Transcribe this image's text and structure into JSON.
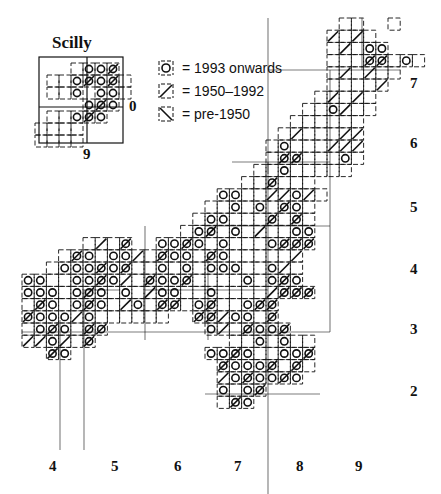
{
  "inset": {
    "title": "Scilly",
    "right_label": "0",
    "bottom_label": "9"
  },
  "legend": [
    {
      "symbol": "circle",
      "label": "= 1993 onwards"
    },
    {
      "symbol": "slash",
      "label": "= 1950–1992"
    },
    {
      "symbol": "backslash",
      "label": "= pre-1950"
    }
  ],
  "x_axis": {
    "labels": [
      "4",
      "5",
      "6",
      "7",
      "8",
      "9"
    ],
    "positions": [
      53,
      115,
      178,
      238,
      300,
      359
    ]
  },
  "y_axis": {
    "labels": [
      "7",
      "6",
      "5",
      "4",
      "3",
      "2"
    ],
    "positions": [
      84,
      144,
      208,
      270,
      330,
      392
    ]
  },
  "grid": {
    "cell": 12.2,
    "origin_x": 22,
    "origin_y": 18
  },
  "colors": {
    "ink": "#111111",
    "background": "#ffffff"
  },
  "main_cells": [
    [
      26,
      0,
      ""
    ],
    [
      27,
      0,
      ""
    ],
    [
      30,
      0,
      ""
    ],
    [
      25,
      1,
      "/"
    ],
    [
      26,
      1,
      ""
    ],
    [
      27,
      1,
      "/"
    ],
    [
      28,
      1,
      ""
    ],
    [
      25,
      2,
      ""
    ],
    [
      26,
      2,
      "/"
    ],
    [
      27,
      2,
      ""
    ],
    [
      28,
      2,
      "o"
    ],
    [
      29,
      2,
      "o"
    ],
    [
      25,
      3,
      ""
    ],
    [
      26,
      3,
      ""
    ],
    [
      27,
      3,
      ""
    ],
    [
      28,
      3,
      "x"
    ],
    [
      29,
      3,
      "x"
    ],
    [
      30,
      3,
      ""
    ],
    [
      31,
      3,
      "o"
    ],
    [
      32,
      3,
      ""
    ],
    [
      25,
      4,
      ""
    ],
    [
      26,
      4,
      "/"
    ],
    [
      27,
      4,
      ""
    ],
    [
      28,
      4,
      "/"
    ],
    [
      29,
      4,
      ""
    ],
    [
      30,
      4,
      ""
    ],
    [
      25,
      5,
      ""
    ],
    [
      26,
      5,
      ""
    ],
    [
      27,
      5,
      ""
    ],
    [
      28,
      5,
      ""
    ],
    [
      29,
      5,
      "/"
    ],
    [
      24,
      6,
      ""
    ],
    [
      25,
      6,
      "/"
    ],
    [
      26,
      6,
      ""
    ],
    [
      27,
      6,
      "/"
    ],
    [
      28,
      6,
      ""
    ],
    [
      23,
      7,
      ""
    ],
    [
      24,
      7,
      ""
    ],
    [
      25,
      7,
      "o"
    ],
    [
      26,
      7,
      "/"
    ],
    [
      27,
      7,
      ""
    ],
    [
      28,
      7,
      ""
    ],
    [
      22,
      8,
      ""
    ],
    [
      23,
      8,
      ""
    ],
    [
      24,
      8,
      ""
    ],
    [
      25,
      8,
      ""
    ],
    [
      26,
      8,
      ""
    ],
    [
      27,
      8,
      ""
    ],
    [
      21,
      9,
      ""
    ],
    [
      22,
      9,
      "/"
    ],
    [
      23,
      9,
      ""
    ],
    [
      24,
      9,
      ""
    ],
    [
      25,
      9,
      ""
    ],
    [
      26,
      9,
      "/"
    ],
    [
      27,
      9,
      "/"
    ],
    [
      20,
      10,
      ""
    ],
    [
      21,
      10,
      "o"
    ],
    [
      22,
      10,
      ""
    ],
    [
      23,
      10,
      ""
    ],
    [
      24,
      10,
      ""
    ],
    [
      25,
      10,
      "/"
    ],
    [
      26,
      10,
      "/"
    ],
    [
      27,
      10,
      "/"
    ],
    [
      20,
      11,
      ""
    ],
    [
      21,
      11,
      "x"
    ],
    [
      22,
      11,
      "x"
    ],
    [
      23,
      11,
      ""
    ],
    [
      24,
      11,
      ""
    ],
    [
      25,
      11,
      ""
    ],
    [
      26,
      11,
      "o"
    ],
    [
      27,
      11,
      ""
    ],
    [
      19,
      12,
      ""
    ],
    [
      20,
      12,
      ""
    ],
    [
      21,
      12,
      "o"
    ],
    [
      22,
      12,
      ""
    ],
    [
      23,
      12,
      ""
    ],
    [
      24,
      12,
      ""
    ],
    [
      25,
      12,
      ""
    ],
    [
      26,
      12,
      ""
    ],
    [
      18,
      13,
      ""
    ],
    [
      19,
      13,
      ""
    ],
    [
      20,
      13,
      "x"
    ],
    [
      21,
      13,
      ""
    ],
    [
      22,
      13,
      ""
    ],
    [
      23,
      13,
      ""
    ],
    [
      16,
      14,
      "o"
    ],
    [
      17,
      14,
      "o"
    ],
    [
      18,
      14,
      ""
    ],
    [
      19,
      14,
      ""
    ],
    [
      20,
      14,
      "/"
    ],
    [
      21,
      14,
      "/"
    ],
    [
      22,
      14,
      "o"
    ],
    [
      23,
      14,
      "/"
    ],
    [
      24,
      14,
      ""
    ],
    [
      15,
      15,
      ""
    ],
    [
      16,
      15,
      ""
    ],
    [
      17,
      15,
      "o"
    ],
    [
      18,
      15,
      ""
    ],
    [
      19,
      15,
      "o"
    ],
    [
      20,
      15,
      ""
    ],
    [
      21,
      15,
      "x"
    ],
    [
      22,
      15,
      "o"
    ],
    [
      23,
      15,
      ""
    ],
    [
      14,
      16,
      ""
    ],
    [
      15,
      16,
      "o"
    ],
    [
      16,
      16,
      "o"
    ],
    [
      17,
      16,
      ""
    ],
    [
      18,
      16,
      ""
    ],
    [
      19,
      16,
      ""
    ],
    [
      20,
      16,
      "x"
    ],
    [
      21,
      16,
      ""
    ],
    [
      22,
      16,
      "x"
    ],
    [
      23,
      16,
      ""
    ],
    [
      13,
      17,
      ""
    ],
    [
      14,
      17,
      "o"
    ],
    [
      15,
      17,
      "x"
    ],
    [
      16,
      17,
      ""
    ],
    [
      17,
      17,
      "o"
    ],
    [
      18,
      17,
      ""
    ],
    [
      19,
      17,
      "/"
    ],
    [
      20,
      17,
      ""
    ],
    [
      21,
      17,
      ""
    ],
    [
      22,
      17,
      "o"
    ],
    [
      23,
      17,
      "o"
    ],
    [
      5,
      18,
      ""
    ],
    [
      6,
      18,
      "/"
    ],
    [
      7,
      18,
      ""
    ],
    [
      8,
      18,
      "x"
    ],
    [
      11,
      18,
      "o"
    ],
    [
      12,
      18,
      "o"
    ],
    [
      13,
      18,
      "x"
    ],
    [
      14,
      18,
      "o"
    ],
    [
      15,
      18,
      ""
    ],
    [
      16,
      18,
      "o"
    ],
    [
      17,
      18,
      ""
    ],
    [
      18,
      18,
      ""
    ],
    [
      19,
      18,
      ""
    ],
    [
      20,
      18,
      "o"
    ],
    [
      21,
      18,
      "x"
    ],
    [
      22,
      18,
      "x"
    ],
    [
      23,
      18,
      "x"
    ],
    [
      3,
      19,
      ""
    ],
    [
      4,
      19,
      "x"
    ],
    [
      5,
      19,
      "o"
    ],
    [
      6,
      19,
      ""
    ],
    [
      7,
      19,
      "o"
    ],
    [
      8,
      19,
      "o"
    ],
    [
      9,
      19,
      "/"
    ],
    [
      10,
      19,
      ""
    ],
    [
      11,
      19,
      "x"
    ],
    [
      12,
      19,
      "o"
    ],
    [
      13,
      19,
      "o"
    ],
    [
      14,
      19,
      ""
    ],
    [
      15,
      19,
      "x"
    ],
    [
      16,
      19,
      "o"
    ],
    [
      17,
      19,
      ""
    ],
    [
      18,
      19,
      ""
    ],
    [
      19,
      19,
      ""
    ],
    [
      20,
      19,
      ""
    ],
    [
      21,
      19,
      ""
    ],
    [
      22,
      19,
      "/"
    ],
    [
      2,
      20,
      ""
    ],
    [
      3,
      20,
      "o"
    ],
    [
      4,
      20,
      "o"
    ],
    [
      5,
      20,
      "o"
    ],
    [
      6,
      20,
      "x"
    ],
    [
      7,
      20,
      "o"
    ],
    [
      8,
      20,
      "x"
    ],
    [
      9,
      20,
      ""
    ],
    [
      10,
      20,
      ""
    ],
    [
      11,
      20,
      "o"
    ],
    [
      12,
      20,
      ""
    ],
    [
      13,
      20,
      "o"
    ],
    [
      14,
      20,
      ""
    ],
    [
      15,
      20,
      "o"
    ],
    [
      16,
      20,
      "o"
    ],
    [
      17,
      20,
      "o"
    ],
    [
      18,
      20,
      ""
    ],
    [
      19,
      20,
      ""
    ],
    [
      20,
      20,
      "o"
    ],
    [
      21,
      20,
      "/"
    ],
    [
      22,
      20,
      ""
    ],
    [
      0,
      21,
      "o"
    ],
    [
      1,
      21,
      "o"
    ],
    [
      2,
      21,
      ""
    ],
    [
      3,
      21,
      ""
    ],
    [
      4,
      21,
      "o"
    ],
    [
      5,
      21,
      "o"
    ],
    [
      6,
      21,
      "x"
    ],
    [
      7,
      21,
      "o"
    ],
    [
      8,
      21,
      "/"
    ],
    [
      9,
      21,
      ""
    ],
    [
      10,
      21,
      "x"
    ],
    [
      11,
      21,
      "o"
    ],
    [
      12,
      21,
      "o"
    ],
    [
      13,
      21,
      "x"
    ],
    [
      14,
      21,
      ""
    ],
    [
      15,
      21,
      ""
    ],
    [
      16,
      21,
      ""
    ],
    [
      17,
      21,
      ""
    ],
    [
      18,
      21,
      "o"
    ],
    [
      19,
      21,
      ""
    ],
    [
      20,
      21,
      "o"
    ],
    [
      21,
      21,
      "x"
    ],
    [
      22,
      21,
      "o"
    ],
    [
      0,
      22,
      "o"
    ],
    [
      1,
      22,
      "o"
    ],
    [
      2,
      22,
      "o"
    ],
    [
      3,
      22,
      ""
    ],
    [
      4,
      22,
      "o"
    ],
    [
      5,
      22,
      "x"
    ],
    [
      6,
      22,
      "o"
    ],
    [
      7,
      22,
      ""
    ],
    [
      8,
      22,
      "o"
    ],
    [
      9,
      22,
      ""
    ],
    [
      10,
      22,
      "/"
    ],
    [
      11,
      22,
      "o"
    ],
    [
      12,
      22,
      "o"
    ],
    [
      13,
      22,
      ""
    ],
    [
      14,
      22,
      ""
    ],
    [
      15,
      22,
      "o"
    ],
    [
      16,
      22,
      ""
    ],
    [
      17,
      22,
      ""
    ],
    [
      18,
      22,
      ""
    ],
    [
      19,
      22,
      ""
    ],
    [
      20,
      22,
      "/"
    ],
    [
      21,
      22,
      "x"
    ],
    [
      22,
      22,
      "x"
    ],
    [
      23,
      22,
      "x"
    ],
    [
      0,
      23,
      ""
    ],
    [
      1,
      23,
      "x"
    ],
    [
      2,
      23,
      "o"
    ],
    [
      3,
      23,
      ""
    ],
    [
      4,
      23,
      "o"
    ],
    [
      5,
      23,
      "x"
    ],
    [
      6,
      23,
      "o"
    ],
    [
      7,
      23,
      ""
    ],
    [
      8,
      23,
      "/"
    ],
    [
      9,
      23,
      "o"
    ],
    [
      10,
      23,
      ""
    ],
    [
      11,
      23,
      "x"
    ],
    [
      12,
      23,
      "x"
    ],
    [
      13,
      23,
      ""
    ],
    [
      14,
      23,
      "o"
    ],
    [
      15,
      23,
      "x"
    ],
    [
      16,
      23,
      ""
    ],
    [
      17,
      23,
      ""
    ],
    [
      18,
      23,
      "o"
    ],
    [
      19,
      23,
      "x"
    ],
    [
      20,
      23,
      "x"
    ],
    [
      0,
      24,
      "x"
    ],
    [
      1,
      24,
      "o"
    ],
    [
      2,
      24,
      "o"
    ],
    [
      3,
      24,
      "o"
    ],
    [
      4,
      24,
      "/"
    ],
    [
      5,
      24,
      "o"
    ],
    [
      6,
      24,
      ""
    ],
    [
      7,
      24,
      ""
    ],
    [
      8,
      24,
      ""
    ],
    [
      9,
      24,
      ""
    ],
    [
      10,
      24,
      ""
    ],
    [
      11,
      24,
      ""
    ],
    [
      14,
      24,
      "x"
    ],
    [
      15,
      24,
      "x"
    ],
    [
      16,
      24,
      "/"
    ],
    [
      17,
      24,
      "o"
    ],
    [
      18,
      24,
      "o"
    ],
    [
      19,
      24,
      ""
    ],
    [
      20,
      24,
      "x"
    ],
    [
      0,
      25,
      ""
    ],
    [
      1,
      25,
      "o"
    ],
    [
      2,
      25,
      "x"
    ],
    [
      3,
      25,
      "o"
    ],
    [
      4,
      25,
      ""
    ],
    [
      5,
      25,
      "x"
    ],
    [
      6,
      25,
      "x"
    ],
    [
      15,
      25,
      "o"
    ],
    [
      16,
      25,
      "/"
    ],
    [
      17,
      25,
      ""
    ],
    [
      18,
      25,
      "x"
    ],
    [
      19,
      25,
      "o"
    ],
    [
      20,
      25,
      "o"
    ],
    [
      21,
      25,
      "x"
    ],
    [
      0,
      26,
      "/"
    ],
    [
      1,
      26,
      "/"
    ],
    [
      2,
      26,
      "o"
    ],
    [
      3,
      26,
      "/"
    ],
    [
      4,
      26,
      ""
    ],
    [
      5,
      26,
      "x"
    ],
    [
      17,
      26,
      ""
    ],
    [
      18,
      26,
      ""
    ],
    [
      19,
      26,
      "o"
    ],
    [
      20,
      26,
      ""
    ],
    [
      21,
      26,
      "o"
    ],
    [
      22,
      26,
      ""
    ],
    [
      23,
      26,
      ""
    ],
    [
      2,
      27,
      "x"
    ],
    [
      3,
      27,
      "o"
    ],
    [
      15,
      27,
      "o"
    ],
    [
      16,
      27,
      "o"
    ],
    [
      17,
      27,
      "x"
    ],
    [
      18,
      27,
      "o"
    ],
    [
      19,
      27,
      ""
    ],
    [
      20,
      27,
      ""
    ],
    [
      21,
      27,
      "o"
    ],
    [
      22,
      27,
      "o"
    ],
    [
      23,
      27,
      "x"
    ],
    [
      16,
      28,
      "x"
    ],
    [
      17,
      28,
      "o"
    ],
    [
      18,
      28,
      "o"
    ],
    [
      19,
      28,
      "o"
    ],
    [
      20,
      28,
      "x"
    ],
    [
      21,
      28,
      ""
    ],
    [
      22,
      28,
      "x"
    ],
    [
      23,
      28,
      ""
    ],
    [
      16,
      29,
      "/"
    ],
    [
      17,
      29,
      "o"
    ],
    [
      18,
      29,
      "x"
    ],
    [
      19,
      29,
      "o"
    ],
    [
      20,
      29,
      "o"
    ],
    [
      21,
      29,
      "x"
    ],
    [
      22,
      29,
      "o"
    ],
    [
      16,
      30,
      "o"
    ],
    [
      17,
      30,
      ""
    ],
    [
      18,
      30,
      "o"
    ],
    [
      19,
      30,
      "x"
    ],
    [
      16,
      31,
      ""
    ],
    [
      17,
      31,
      "x"
    ],
    [
      18,
      31,
      "o"
    ]
  ],
  "inset_cells": [
    [
      3,
      0,
      ""
    ],
    [
      4,
      0,
      "o"
    ],
    [
      5,
      0,
      "o"
    ],
    [
      6,
      0,
      "x"
    ],
    [
      1,
      1,
      ""
    ],
    [
      2,
      1,
      ""
    ],
    [
      3,
      1,
      "o"
    ],
    [
      4,
      1,
      "x"
    ],
    [
      5,
      1,
      "o"
    ],
    [
      6,
      1,
      "x"
    ],
    [
      7,
      1,
      ""
    ],
    [
      1,
      2,
      ""
    ],
    [
      2,
      2,
      ""
    ],
    [
      3,
      2,
      "o"
    ],
    [
      5,
      2,
      "o"
    ],
    [
      6,
      2,
      "o"
    ],
    [
      7,
      2,
      ""
    ],
    [
      4,
      3,
      "o"
    ],
    [
      5,
      3,
      "x"
    ],
    [
      6,
      3,
      "o"
    ],
    [
      1,
      4,
      ""
    ],
    [
      2,
      4,
      ""
    ],
    [
      3,
      4,
      "o"
    ],
    [
      4,
      4,
      "x"
    ],
    [
      5,
      4,
      "o"
    ],
    [
      0,
      5,
      ""
    ],
    [
      1,
      5,
      ""
    ],
    [
      2,
      5,
      ""
    ],
    [
      3,
      5,
      ""
    ],
    [
      0,
      6,
      ""
    ],
    [
      1,
      6,
      ""
    ],
    [
      2,
      6,
      ""
    ],
    [
      3,
      6,
      ""
    ]
  ]
}
